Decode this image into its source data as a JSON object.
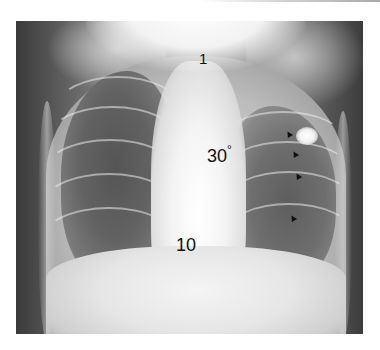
{
  "image": {
    "type": "radiograph",
    "description": "Frontal chest X-ray with numeric annotations and arrowheads",
    "annotations": {
      "label_top": "1",
      "label_middle": "30",
      "label_middle_degree": "°",
      "label_bottom": "10"
    },
    "arrowheads": [
      {
        "name": "arrowhead-1"
      },
      {
        "name": "arrowhead-2"
      },
      {
        "name": "arrowhead-3"
      },
      {
        "name": "arrowhead-4"
      }
    ],
    "colors": {
      "annotation": "#111111",
      "frame_dark": "#3a3a3a",
      "bright": "#ffffff"
    }
  }
}
